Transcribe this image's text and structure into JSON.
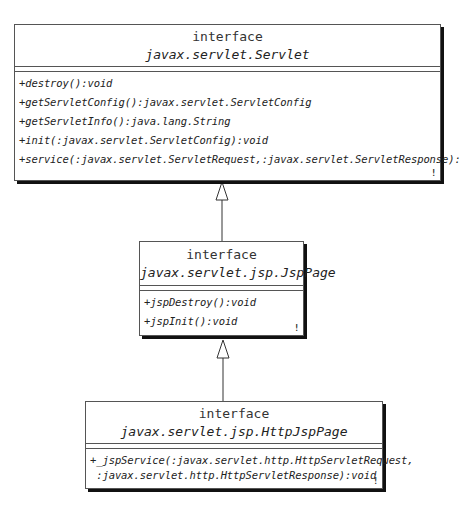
{
  "diagram": {
    "type": "UML class diagram",
    "classes": [
      {
        "stereotype": "interface",
        "name": "javax.servlet.Servlet",
        "operations": [
          "+destroy():void",
          "+getServletConfig():javax.servlet.ServletConfig",
          "+getServletInfo():java.lang.String",
          "+init(:javax.servlet.ServletConfig):void",
          "+service(:javax.servlet.ServletRequest,:javax.servlet.ServletResponse):void"
        ]
      },
      {
        "stereotype": "interface",
        "name": "javax.servlet.jsp.JspPage",
        "operations": [
          "+jspDestroy():void",
          "+jspInit():void"
        ]
      },
      {
        "stereotype": "interface",
        "name": "javax.servlet.jsp.HttpJspPage",
        "operations": [
          "+_jspService(:javax.servlet.http.HttpServletRequest,",
          " :javax.servlet.http.HttpServletResponse):void"
        ]
      }
    ],
    "relationships": [
      {
        "type": "generalization",
        "from": "javax.servlet.jsp.JspPage",
        "to": "javax.servlet.Servlet"
      },
      {
        "type": "generalization",
        "from": "javax.servlet.jsp.HttpJspPage",
        "to": "javax.servlet.jsp.JspPage"
      }
    ],
    "corner_mark": "!"
  }
}
